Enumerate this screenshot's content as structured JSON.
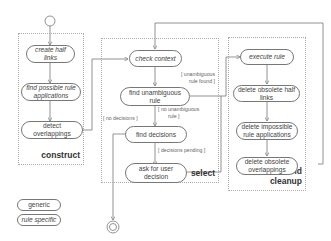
{
  "lanes": {
    "construct": "construct",
    "select": "select",
    "execute_line1": "execute and",
    "execute_line2": "cleanup"
  },
  "nodes": {
    "create_half_links": "create half links",
    "find_possible_rule_applications": "find possible rule applications",
    "detect_overlappings": "detect overlappings",
    "check_context": "check context",
    "find_unambiguous_rule": "find unambiguous rule",
    "find_decisions": "find decisions",
    "ask_for_user_decision": "ask for user decision",
    "execute_rule": "execute rule",
    "delete_obsolete_half_links": "delete obsolete half links",
    "delete_impossible_rule_applications": "delete impossible rule applications",
    "delete_obsolete_overlappings": "delete obsolete overlappings"
  },
  "guards": {
    "unambiguous_rule_found_1": "[ unambiguous",
    "unambiguous_rule_found_2": "rule found ]",
    "no_unambiguous_rule_1": "[ no unambiguous",
    "no_unambiguous_rule_2": "rule ]",
    "no_decisions": "[ no decisions ]",
    "decisions_pending": "[ decisions pending ]"
  },
  "legend": {
    "generic": "generic",
    "rule_specific": "rule specific"
  },
  "colors": {
    "line": "#777777",
    "lane_border": "#aaaaaa",
    "text": "#444444"
  }
}
